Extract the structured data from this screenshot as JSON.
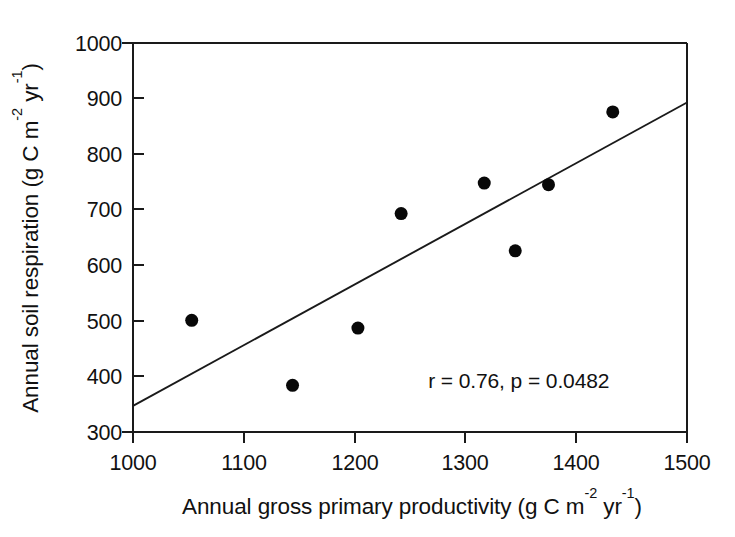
{
  "chart_data": {
    "type": "scatter",
    "title": "",
    "xlabel": "Annual gross primary productivity (g C m-2 yr-1)",
    "ylabel": "Annual soil respiration (g C m-2 yr-1)",
    "xlabel_parts": {
      "base1": "Annual gross primary productivity (g C m",
      "sup1": "-2",
      "mid": " yr",
      "sup2": "-1",
      "tail": ")"
    },
    "ylabel_parts": {
      "base1": "Annual soil respiration (g C m",
      "sup1": "-2",
      "mid": " yr",
      "sup2": "-1",
      "tail": ")"
    },
    "xlim": [
      1000,
      1500
    ],
    "ylim": [
      300,
      1000
    ],
    "xticks": [
      1000,
      1100,
      1200,
      1300,
      1400,
      1500
    ],
    "yticks": [
      300,
      400,
      500,
      600,
      700,
      800,
      900,
      1000
    ],
    "xtick_labels": [
      "1000",
      "1100",
      "1200",
      "1300",
      "1400",
      "1500"
    ],
    "ytick_labels": [
      "300",
      "400",
      "500",
      "600",
      "700",
      "800",
      "900",
      "1000"
    ],
    "grid": false,
    "legend": null,
    "marker": "filled-circle",
    "marker_color": "#080808",
    "marker_size_px": 13,
    "axis_color": "#1a1a1a",
    "background_color": "#ffffff",
    "points": [
      {
        "x": 1053,
        "y": 501
      },
      {
        "x": 1144,
        "y": 384
      },
      {
        "x": 1203,
        "y": 487
      },
      {
        "x": 1242,
        "y": 693
      },
      {
        "x": 1317,
        "y": 748
      },
      {
        "x": 1345,
        "y": 626
      },
      {
        "x": 1375,
        "y": 745
      },
      {
        "x": 1433,
        "y": 876
      }
    ],
    "trend_line": {
      "x": [
        1000,
        1500
      ],
      "y": [
        347,
        893
      ],
      "color": "#1a1a1a"
    },
    "annotations": [
      {
        "text": "r = 0.76, p = 0.0482",
        "x": 1430,
        "y": 380,
        "r_value": "0.76",
        "p_value": "0.0482"
      }
    ]
  },
  "tick_labels": {
    "y": {
      "t1000": "1000",
      "t900": "900",
      "t800": "800",
      "t700": "700",
      "t600": "600",
      "t500": "500",
      "t400": "400",
      "t300": "300"
    },
    "x": {
      "t1000": "1000",
      "t1100": "1100",
      "t1200": "1200",
      "t1300": "1300",
      "t1400": "1400",
      "t1500": "1500"
    }
  },
  "labels": {
    "x_axis_base": "Annual gross primary productivity (g C m",
    "x_axis_sup1": "-2",
    "x_axis_mid": " yr",
    "x_axis_sup2": "-1",
    "x_axis_tail": ")",
    "y_axis_base": "Annual soil respiration (g C m",
    "y_axis_sup1": "-2",
    "y_axis_mid": " yr",
    "y_axis_sup2": "-1",
    "y_axis_tail": ")",
    "stats_annotation": "r = 0.76, p = 0.0482"
  }
}
